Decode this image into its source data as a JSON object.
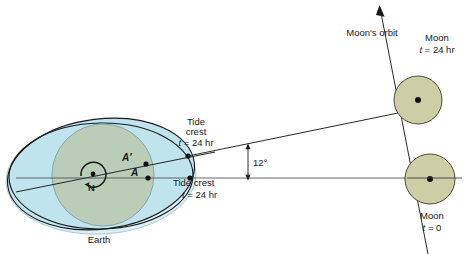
{
  "figure": {
    "background_color": "#ffffff"
  },
  "colors": {
    "earth_land": "#b9cdb9",
    "ocean_bulge": "#bfe4ee",
    "ocean_bulge_2": "#d4eef5",
    "moon_fill": "#cdcda6",
    "outline": "#1a1a1a",
    "line": "#3c3c3c"
  },
  "earth": {
    "label": "Earth",
    "pole_label": "N",
    "point_a_label": "A",
    "point_a_prime_label": "A′",
    "rotation_icon": "rotation-arrow-icon"
  },
  "tide": {
    "crest_upper": {
      "line1": "Tide",
      "line2": "crest",
      "line3_italic": "t",
      "line3_rest": " = 24 hr"
    },
    "crest_lower": {
      "line1": "Tide crest",
      "line2_italic": "t",
      "line2_rest": " = 24 hr"
    }
  },
  "angle": {
    "value": "12°"
  },
  "moon_orbit": {
    "label": "Moon's orbit",
    "arrow_icon": "orbit-arrow-icon"
  },
  "moon_upper": {
    "name": "Moon",
    "time_italic": "t",
    "time_rest": " = 24 hr"
  },
  "moon_lower": {
    "name": "Moon",
    "time_italic": "t",
    "time_rest": " = 0"
  }
}
